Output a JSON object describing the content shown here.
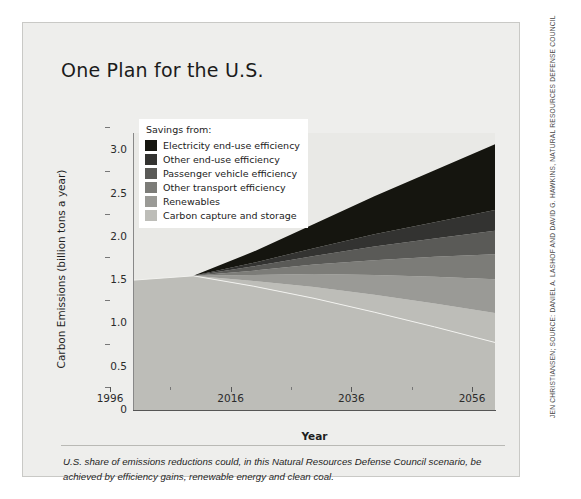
{
  "title": "One Plan for the U.S.",
  "credit": "JEN CHRISTIANSEN; SOURCE: DANIEL A. LASHOF AND DAVID G. HAWKINS, NATURAL RESOURCES DEFENSE COUNCIL",
  "caption": "U.S. share of emissions reductions could, in this Natural Resources Defense Council scenario, be achieved by efficiency gains, renewable energy and clean coal.",
  "legend": {
    "title": "Savings from:"
  },
  "chart_data": {
    "type": "area",
    "title": "One Plan for the U.S.",
    "xlabel": "Year",
    "ylabel": "Carbon Emissions (billion tons a year)",
    "xlim": [
      1996,
      2056
    ],
    "ylim": [
      0,
      3.2
    ],
    "xticks": [
      1996,
      2016,
      2036,
      2056
    ],
    "xticks_minor": [
      2006,
      2026,
      2046
    ],
    "yticks": [
      0,
      0.5,
      1.0,
      1.5,
      2.0,
      2.5,
      3.0
    ],
    "ytick_labels": [
      "0",
      "0.5",
      "1.0",
      "1.5",
      "2.0",
      "2.5",
      "3.0"
    ],
    "grid": false,
    "legend_position": "upper-left-inside",
    "stacking": "stacked-from-bottom",
    "note": "Bottom band is remaining emissions; wedges above it are cumulative savings that fan out from a common apex near 2006.",
    "x": [
      1996,
      2006,
      2016,
      2026,
      2036,
      2046,
      2056
    ],
    "series": [
      {
        "name": "Remaining emissions",
        "color": "#bdbdb8",
        "in_legend": false,
        "values": [
          1.5,
          1.55,
          1.43,
          1.29,
          1.13,
          0.96,
          0.78
        ]
      },
      {
        "name": "Carbon capture and storage",
        "color": "#bdbdb8",
        "in_legend": true,
        "values": [
          0.0,
          0.0,
          0.06,
          0.13,
          0.2,
          0.27,
          0.34
        ]
      },
      {
        "name": "Renewables",
        "color": "#9a9a96",
        "in_legend": true,
        "values": [
          0.0,
          0.0,
          0.07,
          0.15,
          0.23,
          0.31,
          0.39
        ]
      },
      {
        "name": "Other transport efficiency",
        "color": "#7c7c78",
        "in_legend": true,
        "values": [
          0.0,
          0.0,
          0.05,
          0.11,
          0.17,
          0.23,
          0.29
        ]
      },
      {
        "name": "Passenger vehicle efficiency",
        "color": "#5a5a57",
        "in_legend": true,
        "values": [
          0.0,
          0.0,
          0.05,
          0.1,
          0.16,
          0.21,
          0.27
        ]
      },
      {
        "name": "Other end-use efficiency",
        "color": "#333331",
        "in_legend": true,
        "values": [
          0.0,
          0.0,
          0.04,
          0.09,
          0.14,
          0.19,
          0.24
        ]
      },
      {
        "name": "Electricity end-use efficiency",
        "color": "#15150f",
        "in_legend": true,
        "values": [
          0.0,
          0.0,
          0.13,
          0.28,
          0.44,
          0.6,
          0.76
        ]
      }
    ],
    "totals": [
      1.5,
      1.55,
      1.83,
      2.15,
      2.47,
      2.77,
      3.07
    ],
    "legend_entries": [
      {
        "label": "Electricity end-use efficiency",
        "color": "#15150f"
      },
      {
        "label": "Other end-use efficiency",
        "color": "#333331"
      },
      {
        "label": "Passenger vehicle efficiency",
        "color": "#5a5a57"
      },
      {
        "label": "Other transport efficiency",
        "color": "#7c7c78"
      },
      {
        "label": "Renewables",
        "color": "#9a9a96"
      },
      {
        "label": "Carbon capture and storage",
        "color": "#bdbdb8"
      }
    ]
  }
}
